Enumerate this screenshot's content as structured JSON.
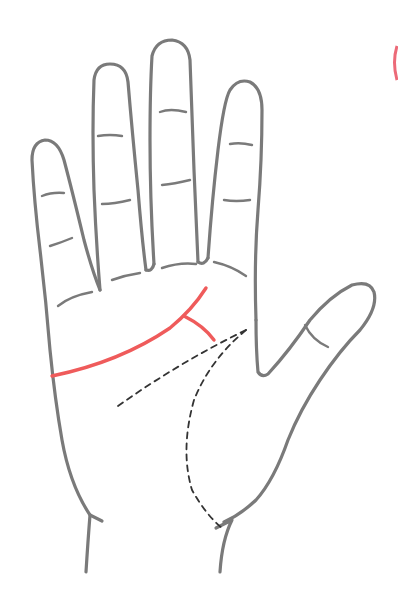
{
  "diagram": {
    "highlighted_line": "heart-line",
    "colors": {
      "outline": "#7a7a7a",
      "highlight": "#ef5b5b",
      "dashed": "#333333",
      "background": "#ffffff",
      "edge_arc": "#ec6a78"
    },
    "elements": [
      {
        "name": "hand-outline",
        "style": "solid-gray"
      },
      {
        "name": "finger-creases",
        "style": "solid-gray"
      },
      {
        "name": "heart-line",
        "style": "solid-red",
        "branch": "fork-near-index-finger"
      },
      {
        "name": "head-line",
        "style": "dashed-dark"
      },
      {
        "name": "life-line",
        "style": "dashed-dark"
      }
    ]
  }
}
